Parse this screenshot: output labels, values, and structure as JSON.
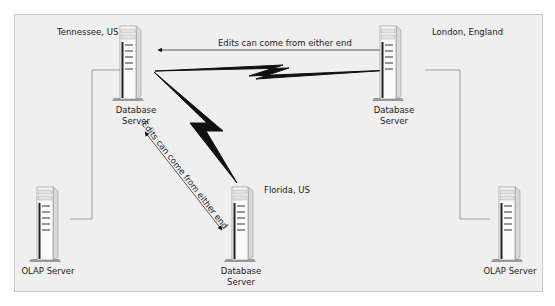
{
  "diagram": {
    "nodes": [
      {
        "id": "tennessee-db",
        "location": "Tennessee, US",
        "label_line1": "Database",
        "label_line2": "Server"
      },
      {
        "id": "london-db",
        "location": "London, England",
        "label_line1": "Database",
        "label_line2": "Server"
      },
      {
        "id": "florida-db",
        "location": "Florida, US",
        "label_line1": "Database",
        "label_line2": "Server"
      },
      {
        "id": "olap-left",
        "label_line1": "OLAP Server"
      },
      {
        "id": "olap-right",
        "label_line1": "OLAP Server"
      }
    ],
    "edges": [
      {
        "from": "tennessee-db",
        "to": "london-db",
        "type": "wan-link",
        "label": "Edits can come from either end",
        "bidirectional": true
      },
      {
        "from": "tennessee-db",
        "to": "florida-db",
        "type": "wan-link",
        "label": "Edits can come from either end",
        "bidirectional": true
      },
      {
        "from": "tennessee-db",
        "to": "olap-left",
        "type": "lan-link"
      },
      {
        "from": "london-db",
        "to": "olap-right",
        "type": "lan-link"
      }
    ],
    "colors": {
      "background": "#efefef",
      "frame_border": "#c9c9c9",
      "wan_bolt": "#111111",
      "lan_line": "#888888",
      "text": "#222222"
    }
  }
}
